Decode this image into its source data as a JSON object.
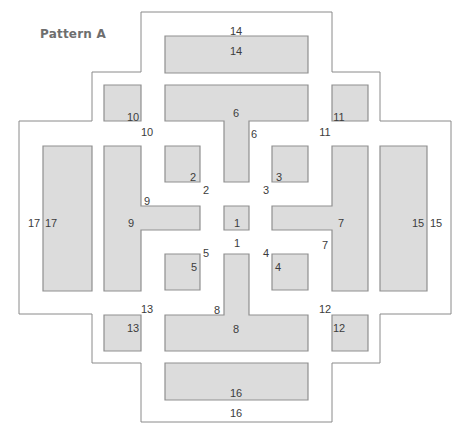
{
  "title": "Pattern A",
  "colors": {
    "block_fill": "#dcdcdc",
    "block_stroke": "#8f8f8f",
    "outline_stroke": "#8a8a8a",
    "label": "#3c3c3c",
    "title": "#6e6e6e"
  },
  "outline_path": "M141,12 L332,12 L332,72 L380,72 L380,121 L451,121 L451,314 L380,314 L380,363 L332,363 L332,422 L141,422 L141,363 L92,363 L92,314 L19,314 L19,121 L92,121 L92,72 L141,72 Z",
  "blocks": [
    {
      "id": "1",
      "path": "M224,206 L249,206 L249,230 L224,230 Z",
      "inner_label": {
        "text": "1",
        "x": 237,
        "y": 223
      },
      "outer_label": {
        "text": "1",
        "x": 237,
        "y": 243
      }
    },
    {
      "id": "2",
      "path": "M165,146 L200,146 L200,182 L165,182 Z",
      "inner_label": {
        "text": "2",
        "x": 193,
        "y": 177
      },
      "outer_label": {
        "text": "2",
        "x": 206,
        "y": 190
      }
    },
    {
      "id": "3",
      "path": "M272,146 L308,146 L308,182 L272,182 Z",
      "inner_label": {
        "text": "3",
        "x": 279,
        "y": 177
      },
      "outer_label": {
        "text": "3",
        "x": 266,
        "y": 190
      }
    },
    {
      "id": "4",
      "path": "M272,254 L308,254 L308,290 L272,290 Z",
      "inner_label": {
        "text": "4",
        "x": 278,
        "y": 267
      },
      "outer_label": {
        "text": "4",
        "x": 266,
        "y": 253
      }
    },
    {
      "id": "5",
      "path": "M165,254 L200,254 L200,290 L165,290 Z",
      "inner_label": {
        "text": "5",
        "x": 194,
        "y": 267
      },
      "outer_label": {
        "text": "5",
        "x": 206,
        "y": 253
      }
    },
    {
      "id": "6",
      "path": "M165,85 L308,85 L308,121 L249,121 L249,182 L224,182 L224,121 L165,121 Z",
      "inner_label": {
        "text": "6",
        "x": 236,
        "y": 113
      },
      "outer_label": {
        "text": "6",
        "x": 254,
        "y": 134
      }
    },
    {
      "id": "7",
      "path": "M332,146 L368,146 L368,291 L332,291 L332,230 L272,230 L272,206 L332,206 Z",
      "inner_label": {
        "text": "7",
        "x": 341,
        "y": 223
      },
      "outer_label": {
        "text": "7",
        "x": 325,
        "y": 245
      }
    },
    {
      "id": "8",
      "path": "M224,254 L249,254 L249,315 L308,315 L308,351 L165,351 L165,315 L224,315 Z",
      "inner_label": {
        "text": "8",
        "x": 236,
        "y": 329
      },
      "outer_label": {
        "text": "8",
        "x": 217,
        "y": 310
      }
    },
    {
      "id": "9",
      "path": "M104,146 L141,146 L141,206 L200,206 L200,230 L141,230 L141,291 L104,291 Z",
      "inner_label": {
        "text": "9",
        "x": 131,
        "y": 223
      },
      "outer_label": {
        "text": "9",
        "x": 147,
        "y": 201
      }
    },
    {
      "id": "10",
      "path": "M104,85 L141,85 L141,121 L104,121 Z",
      "inner_label": {
        "text": "10",
        "x": 133,
        "y": 117
      },
      "outer_label": {
        "text": "10",
        "x": 147,
        "y": 132
      }
    },
    {
      "id": "11",
      "path": "M332,85 L368,85 L368,121 L332,121 Z",
      "inner_label": {
        "text": "11",
        "x": 339,
        "y": 117
      },
      "outer_label": {
        "text": "11",
        "x": 325,
        "y": 132
      }
    },
    {
      "id": "12",
      "path": "M332,315 L368,315 L368,351 L332,351 Z",
      "inner_label": {
        "text": "12",
        "x": 339,
        "y": 328
      },
      "outer_label": {
        "text": "12",
        "x": 325,
        "y": 309
      }
    },
    {
      "id": "13",
      "path": "M104,315 L141,315 L141,351 L104,351 Z",
      "inner_label": {
        "text": "13",
        "x": 133,
        "y": 328
      },
      "outer_label": {
        "text": "13",
        "x": 147,
        "y": 309
      }
    },
    {
      "id": "14",
      "path": "M165,36 L308,36 L308,73 L165,73 Z",
      "inner_label": {
        "text": "14",
        "x": 236,
        "y": 51
      },
      "outer_label": {
        "text": "14",
        "x": 236,
        "y": 31
      }
    },
    {
      "id": "15",
      "path": "M380,146 L427,146 L427,291 L380,291 Z",
      "inner_label": {
        "text": "15",
        "x": 418,
        "y": 223
      },
      "outer_label": {
        "text": "15",
        "x": 436,
        "y": 223
      }
    },
    {
      "id": "16",
      "path": "M165,363 L308,363 L308,400 L165,400 Z",
      "inner_label": {
        "text": "16",
        "x": 236,
        "y": 393
      },
      "outer_label": {
        "text": "16",
        "x": 236,
        "y": 413
      }
    },
    {
      "id": "17",
      "path": "M43,146 L92,146 L92,291 L43,291 Z",
      "inner_label": {
        "text": "17",
        "x": 51,
        "y": 223
      },
      "outer_label": {
        "text": "17",
        "x": 34,
        "y": 223
      }
    }
  ]
}
